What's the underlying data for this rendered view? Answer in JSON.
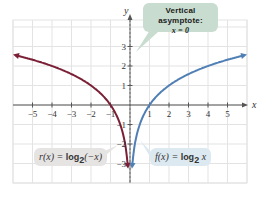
{
  "chart_data": {
    "type": "line",
    "title": "",
    "xlabel": "x",
    "ylabel": "y",
    "xlim": [
      -6,
      6
    ],
    "ylim": [
      -3.5,
      4
    ],
    "grid": true,
    "x_ticks": [
      -5,
      -4,
      -3,
      -2,
      -1,
      1,
      2,
      3,
      4,
      5
    ],
    "y_ticks": [
      -3,
      -2,
      -1,
      1,
      2,
      3
    ],
    "series": [
      {
        "name": "r(x) = log2(-x)",
        "color": "#7a1f35",
        "x": [
          -5.8,
          -5,
          -4,
          -3,
          -2,
          -1,
          -0.5,
          -0.25,
          -0.125
        ],
        "y": [
          2.54,
          2.32,
          2.0,
          1.58,
          1.0,
          0.0,
          -1.0,
          -2.0,
          -3.0
        ]
      },
      {
        "name": "f(x) = log2 x",
        "color": "#4f7fb4",
        "x": [
          0.125,
          0.25,
          0.5,
          1,
          2,
          3,
          4,
          5,
          5.8
        ],
        "y": [
          -3.0,
          -2.0,
          -1.0,
          0.0,
          1.0,
          1.58,
          2.0,
          2.32,
          2.54
        ]
      }
    ],
    "annotations": [
      {
        "text": "Vertical asymptote: x = 0"
      },
      {
        "text": "r(x) = log2(-x)"
      },
      {
        "text": "f(x) = log2 x"
      }
    ]
  },
  "labels": {
    "asym_title": "Vertical asymptote:",
    "asym_eq": "x = 0",
    "r_fn": "r(x) = ",
    "r_log": "log",
    "r_base": "2",
    "r_arg": "(−x)",
    "f_fn": "f(x) = ",
    "f_log": "log",
    "f_base": "2",
    "f_arg": " x",
    "x_axis": "x",
    "y_axis": "y"
  }
}
